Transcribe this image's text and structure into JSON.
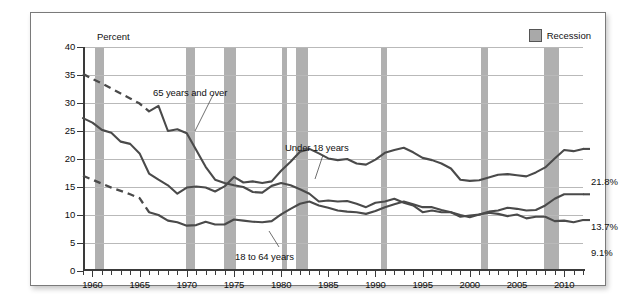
{
  "axis_title": "Percent",
  "legend": {
    "label": "Recession",
    "swatch_color": "#a9a9a9"
  },
  "series_labels": {
    "older": "65 years and over",
    "under18": "Under 18 years",
    "adults": "18 to 64 years"
  },
  "end_labels": {
    "under18": "21.8%",
    "adults": "13.7%",
    "older": "9.1%"
  },
  "y_ticks": [
    "0",
    "5",
    "10",
    "15",
    "20",
    "25",
    "30",
    "35",
    "40"
  ],
  "x_ticks": [
    "1960",
    "1965",
    "1970",
    "1975",
    "1980",
    "1985",
    "1990",
    "1995",
    "2000",
    "2005",
    "2010"
  ],
  "chart_data": {
    "type": "line",
    "title": "Percent",
    "xlabel": "",
    "ylabel": "Percent",
    "xlim": [
      1959,
      2012
    ],
    "ylim": [
      0,
      40
    ],
    "y_ticks": [
      0,
      5,
      10,
      15,
      20,
      25,
      30,
      35,
      40
    ],
    "x_ticks": [
      1960,
      1965,
      1970,
      1975,
      1980,
      1985,
      1990,
      1995,
      2000,
      2005,
      2010
    ],
    "grid": "horizontal",
    "legend_position": "top-right",
    "legend_entries": [
      "Recession"
    ],
    "annotations": [
      "65 years and over",
      "Under 18 years",
      "18 to 64 years",
      "21.8%",
      "13.7%",
      "9.1%"
    ],
    "series": [
      {
        "name": "65 years and over",
        "end_value": 9.1,
        "dashed_segment_years": [
          1959,
          1966
        ],
        "x": [
          1959,
          1960,
          1961,
          1962,
          1963,
          1964,
          1965,
          1966,
          1967,
          1968,
          1969,
          1970,
          1971,
          1972,
          1973,
          1974,
          1975,
          1976,
          1977,
          1978,
          1979,
          1980,
          1981,
          1982,
          1983,
          1984,
          1985,
          1986,
          1987,
          1988,
          1989,
          1990,
          1991,
          1992,
          1993,
          1994,
          1995,
          1996,
          1997,
          1998,
          1999,
          2000,
          2001,
          2002,
          2003,
          2004,
          2005,
          2006,
          2007,
          2008,
          2009,
          2010,
          2011,
          2012
        ],
        "values": [
          35.2,
          34.3,
          33.5,
          32.6,
          31.7,
          30.8,
          29.9,
          28.5,
          29.5,
          25.0,
          25.3,
          24.6,
          21.6,
          18.6,
          16.3,
          15.7,
          15.3,
          15.0,
          14.1,
          14.0,
          15.2,
          15.7,
          15.3,
          14.6,
          13.8,
          12.4,
          12.6,
          12.4,
          12.5,
          12.0,
          11.4,
          12.2,
          12.4,
          12.9,
          12.2,
          11.7,
          10.5,
          10.8,
          10.5,
          10.5,
          9.7,
          9.9,
          10.1,
          10.4,
          10.2,
          9.8,
          10.1,
          9.4,
          9.7,
          9.7,
          8.9,
          9.0,
          8.7,
          9.1
        ]
      },
      {
        "name": "Under 18 years",
        "end_value": 21.8,
        "x": [
          1959,
          1960,
          1961,
          1962,
          1963,
          1964,
          1965,
          1966,
          1967,
          1968,
          1969,
          1970,
          1971,
          1972,
          1973,
          1974,
          1975,
          1976,
          1977,
          1978,
          1979,
          1980,
          1981,
          1982,
          1983,
          1984,
          1985,
          1986,
          1987,
          1988,
          1989,
          1990,
          1991,
          1992,
          1993,
          1994,
          1995,
          1996,
          1997,
          1998,
          1999,
          2000,
          2001,
          2002,
          2003,
          2004,
          2005,
          2006,
          2007,
          2008,
          2009,
          2010,
          2011,
          2012
        ],
        "values": [
          27.3,
          26.5,
          25.2,
          24.7,
          23.1,
          22.7,
          21.0,
          17.4,
          16.3,
          15.3,
          13.8,
          14.9,
          15.1,
          14.9,
          14.2,
          15.1,
          16.8,
          15.8,
          16.0,
          15.7,
          16.0,
          17.9,
          19.5,
          21.3,
          21.8,
          21.0,
          20.1,
          19.8,
          20.0,
          19.2,
          19.0,
          19.9,
          21.1,
          21.6,
          22.0,
          21.2,
          20.2,
          19.8,
          19.2,
          18.3,
          16.3,
          16.1,
          16.2,
          16.7,
          17.2,
          17.3,
          17.1,
          16.9,
          17.6,
          18.5,
          20.1,
          21.6,
          21.4,
          21.8
        ]
      },
      {
        "name": "18 to 64 years",
        "end_value": 13.7,
        "dashed_segment_years": [
          1959,
          1966
        ],
        "x": [
          1959,
          1960,
          1961,
          1962,
          1963,
          1964,
          1965,
          1966,
          1967,
          1968,
          1969,
          1970,
          1971,
          1972,
          1973,
          1974,
          1975,
          1976,
          1977,
          1978,
          1979,
          1980,
          1981,
          1982,
          1983,
          1984,
          1985,
          1986,
          1987,
          1988,
          1989,
          1990,
          1991,
          1992,
          1993,
          1994,
          1995,
          1996,
          1997,
          1998,
          1999,
          2000,
          2001,
          2002,
          2003,
          2004,
          2005,
          2006,
          2007,
          2008,
          2009,
          2010,
          2011,
          2012
        ],
        "values": [
          17.0,
          16.3,
          15.6,
          14.9,
          14.3,
          13.7,
          13.0,
          10.5,
          10.0,
          9.0,
          8.7,
          8.1,
          8.2,
          8.8,
          8.3,
          8.3,
          9.2,
          9.0,
          8.8,
          8.7,
          8.9,
          10.1,
          11.1,
          12.0,
          12.4,
          11.7,
          11.3,
          10.8,
          10.6,
          10.5,
          10.2,
          10.7,
          11.4,
          11.9,
          12.4,
          11.9,
          11.4,
          11.4,
          10.9,
          10.5,
          10.0,
          9.6,
          10.1,
          10.6,
          10.8,
          11.3,
          11.1,
          10.8,
          10.9,
          11.7,
          12.9,
          13.7,
          13.7,
          13.7
        ]
      }
    ],
    "recessions": [
      {
        "start": 1960.3,
        "end": 1961.2
      },
      {
        "start": 1969.9,
        "end": 1970.9
      },
      {
        "start": 1973.9,
        "end": 1975.2
      },
      {
        "start": 1980.1,
        "end": 1980.6
      },
      {
        "start": 1981.6,
        "end": 1982.9
      },
      {
        "start": 1990.6,
        "end": 1991.2
      },
      {
        "start": 2001.2,
        "end": 2001.9
      },
      {
        "start": 2007.9,
        "end": 2009.5
      }
    ]
  }
}
